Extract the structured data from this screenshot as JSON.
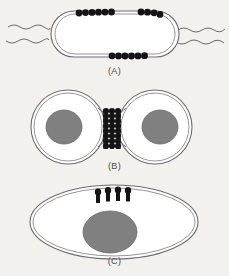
{
  "figure": {
    "background_color": "#f2f1ee",
    "ink_color": "#3a3a3a",
    "nucleoid_color": "#808080",
    "nucleoid_edge_color": "#6b6b6b",
    "bead_color": "#1a1a1a",
    "envelope_color": "#5a5a5a"
  },
  "panels": [
    {
      "id": "A",
      "label": "(A)",
      "shape": "rod-shaped-cell",
      "description": "Rod-shaped (capsule) bacterial cell with double-line envelope, wavy flagella at both ends, and three clusters of membrane-bound beads on the envelope",
      "bead_clusters": [
        {
          "name": "top-left-cluster",
          "count": 6,
          "position": "top-left"
        },
        {
          "name": "top-right-cluster",
          "count": 4,
          "position": "top-right"
        },
        {
          "name": "bottom-center-cluster",
          "count": 6,
          "position": "bottom-center"
        }
      ],
      "flagella": {
        "left_count": 2,
        "right_count": 2
      }
    },
    {
      "id": "B",
      "label": "(B)",
      "shape": "two-dividing-cells",
      "description": "Two daughter cells joined at a septum; each contains a grey nucleoid; the septum is spanned by stacked rows of beads",
      "nucleoids": 2,
      "bridge_rows": 8,
      "beads_per_row": 3
    },
    {
      "id": "C",
      "label": "(C)",
      "shape": "oval-cell",
      "description": "Single oval cell with one grey nucleoid and four stalked bead structures on the upper envelope",
      "nucleoids": 1,
      "stalk_count": 4
    }
  ],
  "labels": {
    "a": "(A)",
    "b": "(B)",
    "c": "(C)"
  }
}
